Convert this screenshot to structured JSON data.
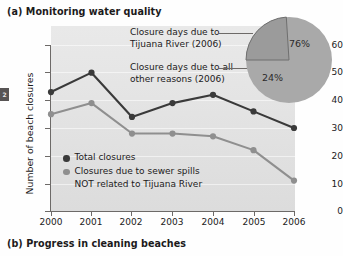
{
  "headings": {
    "panel_a": "(a) Monitoring water quality",
    "panel_b": "(b) Progress in cleaning beaches"
  },
  "page_tab": "2",
  "callouts": {
    "tijuana_line1": "Closure days due to",
    "tijuana_line2": "Tijuana River (2006)",
    "other_line1": "Closure days due to all",
    "other_line2": "other reasons (2006)"
  },
  "legend": {
    "series1_label": "Total closures",
    "series2_label": "Closures due to sewer spills",
    "series2_label_line2": "NOT related to Tijuana River"
  },
  "colors": {
    "total_closures": "#3a3a3a",
    "sewer_spills": "#8f8f8f",
    "pie_major": "#a9a9a9",
    "pie_minor": "#9a9a9a",
    "plot_background": "#e4e4e4",
    "axis": "#6d6a68"
  },
  "chart_data": [
    {
      "type": "line",
      "title": "(a) Monitoring water quality",
      "xlabel": "",
      "ylabel": "Number of beach closures",
      "categories": [
        "2000",
        "2001",
        "2002",
        "2003",
        "2004",
        "2005",
        "2006"
      ],
      "x": [
        2000,
        2001,
        2002,
        2003,
        2004,
        2005,
        2006
      ],
      "ylim": [
        0,
        60
      ],
      "yticks": [
        0,
        10,
        20,
        30,
        40,
        50,
        60
      ],
      "grid": true,
      "legend_position": "inside-lower-left",
      "series": [
        {
          "name": "Total closures",
          "color": "#3a3a3a",
          "values": [
            43,
            50,
            34,
            39,
            42,
            36,
            30
          ]
        },
        {
          "name": "Closures due to sewer spills NOT related to Tijuana River",
          "color": "#8f8f8f",
          "values": [
            35,
            39,
            28,
            28,
            27,
            22,
            11
          ]
        }
      ]
    },
    {
      "type": "pie",
      "title": "Closure days 2006",
      "labels": [
        "Closure days due to Tijuana River (2006)",
        "Closure days due to all other reasons (2006)"
      ],
      "data_labels": [
        "76%",
        "24%"
      ],
      "values": [
        76,
        24
      ],
      "colors": [
        "#a9a9a9",
        "#9a9a9a"
      ],
      "legend_position": "callout-left"
    }
  ],
  "axis": {
    "y_title": "Number of beach closures",
    "y_ticks": [
      "60",
      "50",
      "40",
      "30",
      "20",
      "10",
      "0"
    ],
    "x_ticks": [
      "2000",
      "2001",
      "2002",
      "2003",
      "2004",
      "2005",
      "2006"
    ]
  },
  "pie": {
    "major_value": "76%",
    "minor_value": "24%"
  }
}
